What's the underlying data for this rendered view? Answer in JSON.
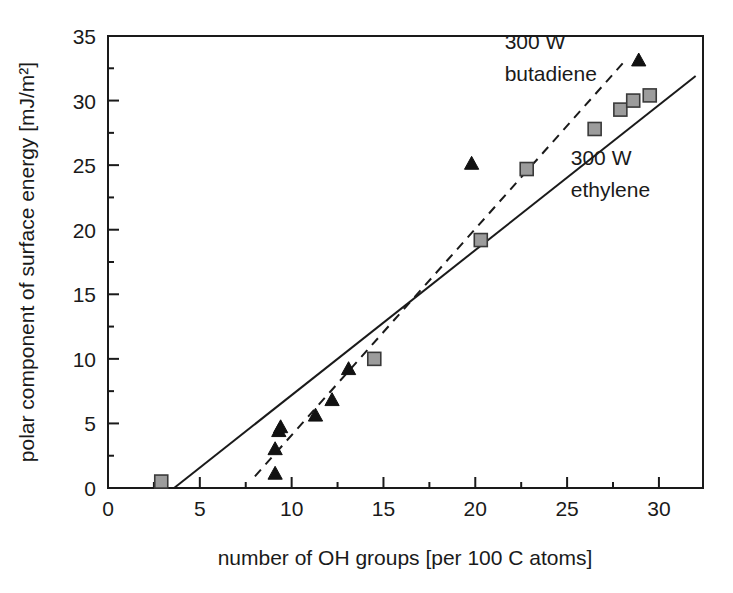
{
  "chart_data": {
    "type": "scatter",
    "title": "",
    "xlabel": "number of OH groups [per 100 C atoms]",
    "ylabel": "polar component of surface energy [mJ/m²]",
    "xlim": [
      0,
      32.4
    ],
    "ylim": [
      0,
      35
    ],
    "xticks": [
      0,
      5,
      10,
      15,
      20,
      25,
      30
    ],
    "yticks": [
      0,
      5,
      10,
      15,
      20,
      25,
      30,
      35
    ],
    "xtick_labels": [
      "0",
      "5",
      "10",
      "15",
      "20",
      "25",
      "30"
    ],
    "ytick_labels": [
      "0",
      "5",
      "10",
      "15",
      "20",
      "25",
      "30",
      "35"
    ],
    "minor_ticks": true,
    "grid": false,
    "legend_position": "inline-annotations",
    "series": [
      {
        "name": "300 W ethylene",
        "marker": "square",
        "marker_color": "#9c9c9c",
        "marker_edge_color": "#3a3a3a",
        "fit_line_style": "solid",
        "points": [
          {
            "x": 2.9,
            "y": 0.5
          },
          {
            "x": 14.5,
            "y": 10.0
          },
          {
            "x": 20.3,
            "y": 19.2
          },
          {
            "x": 22.8,
            "y": 24.7
          },
          {
            "x": 26.5,
            "y": 27.8
          },
          {
            "x": 27.9,
            "y": 29.3
          },
          {
            "x": 28.6,
            "y": 30.0
          },
          {
            "x": 29.5,
            "y": 30.4
          }
        ]
      },
      {
        "name": "300 W butadiene",
        "marker": "triangle",
        "marker_color": "#111111",
        "marker_edge_color": "#111111",
        "fit_line_style": "dashed",
        "points": [
          {
            "x": 9.1,
            "y": 1.1
          },
          {
            "x": 9.1,
            "y": 3.0
          },
          {
            "x": 9.3,
            "y": 4.4
          },
          {
            "x": 9.4,
            "y": 4.7
          },
          {
            "x": 11.3,
            "y": 5.6
          },
          {
            "x": 12.2,
            "y": 6.8
          },
          {
            "x": 13.1,
            "y": 9.2
          },
          {
            "x": 19.8,
            "y": 25.1
          },
          {
            "x": 28.9,
            "y": 33.1
          }
        ]
      }
    ],
    "fit_lines": [
      {
        "name": "300 W ethylene",
        "style": "solid",
        "x_start": 3.6,
        "y_start": 0.0,
        "x_end": 32.0,
        "y_end": 31.9
      },
      {
        "name": "300 W butadiene",
        "style": "dashed",
        "x_start": 8.0,
        "y_start": 0.9,
        "x_end": 28.1,
        "y_end": 33.0
      }
    ],
    "annotations": [
      {
        "id": "butadiene-label",
        "line1": "300 W",
        "line2": "butadiene",
        "x": 21.6,
        "y": 34.0
      },
      {
        "id": "ethylene-label",
        "line1": "300 W",
        "line2": "ethylene",
        "x": 25.2,
        "y": 25.0
      }
    ]
  },
  "axes": {
    "x_title": "number of OH groups [per 100 C atoms]",
    "y_title": "polar component of surface energy [mJ/m²]"
  },
  "annotation_text": {
    "butadiene_line1": "300 W",
    "butadiene_line2": "butadiene",
    "ethylene_line1": "300 W",
    "ethylene_line2": "ethylene"
  },
  "colors": {
    "axis": "#1a1a1a",
    "square_fill": "#9c9c9c",
    "square_edge": "#3a3a3a",
    "triangle_fill": "#111111",
    "background": "#ffffff"
  }
}
